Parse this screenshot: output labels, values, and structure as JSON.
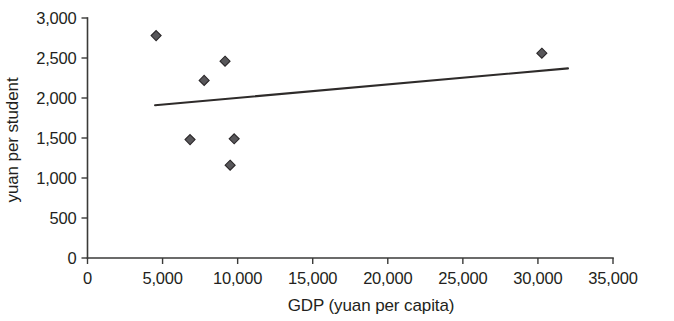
{
  "chart_data": {
    "type": "scatter",
    "title": "",
    "subtitle": "",
    "xlabel": "GDP (yuan per capita)",
    "ylabel": "yuan per student",
    "xlim": [
      0,
      35000
    ],
    "ylim": [
      0,
      3000
    ],
    "xticks": [
      0,
      5000,
      10000,
      15000,
      20000,
      25000,
      30000,
      35000
    ],
    "yticks": [
      0,
      500,
      1000,
      1500,
      2000,
      2500,
      3000
    ],
    "xtick_labels": [
      "0",
      "5,000",
      "10,000",
      "15,000",
      "20,000",
      "25,000",
      "30,000",
      "35,000"
    ],
    "ytick_labels": [
      "0",
      "500",
      "1,000",
      "1,500",
      "2,000",
      "2,500",
      "3,000"
    ],
    "grid": false,
    "legend": false,
    "legend_position": "none",
    "marker_shape": "diamond",
    "marker_color": "#58575a",
    "series": [
      {
        "name": "provinces",
        "points": [
          {
            "x": 4570,
            "y": 2780
          },
          {
            "x": 6830,
            "y": 1480
          },
          {
            "x": 7770,
            "y": 2220
          },
          {
            "x": 9160,
            "y": 2460
          },
          {
            "x": 9770,
            "y": 1490
          },
          {
            "x": 9500,
            "y": 1160
          },
          {
            "x": 30260,
            "y": 2560
          }
        ]
      }
    ],
    "trendline": {
      "type": "linear",
      "color": "#2e2b2a",
      "x_start": 4500,
      "y_start": 1910,
      "x_end": 32000,
      "y_end": 2370
    }
  },
  "axes": {
    "x_axis_title": "GDP (yuan per capita)",
    "y_axis_title": "yuan per student"
  }
}
